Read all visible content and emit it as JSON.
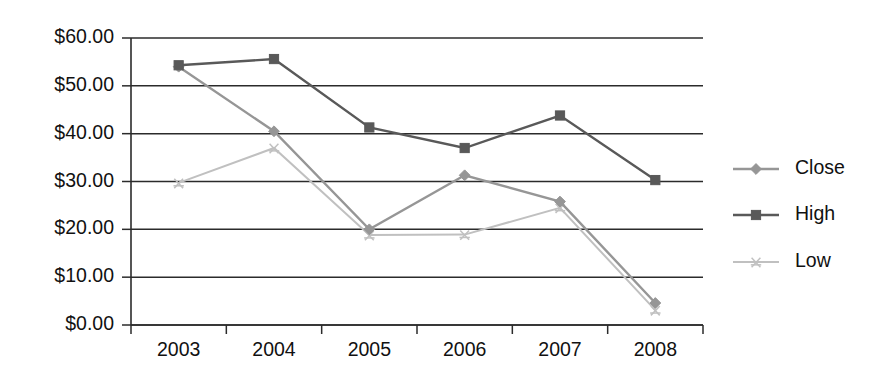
{
  "chart_data": {
    "type": "line",
    "title": "",
    "subtitle": "",
    "xlabel": "",
    "ylabel": "",
    "categories": [
      "2003",
      "2004",
      "2005",
      "2006",
      "2007",
      "2008"
    ],
    "ytick_labels": [
      "$60.00",
      "$50.00",
      "$40.00",
      "$30.00",
      "$20.00",
      "$10.00",
      "$0.00"
    ],
    "ytick_values": [
      60,
      50,
      40,
      30,
      20,
      10,
      0
    ],
    "ylim": [
      0,
      60
    ],
    "grid": "horizontal",
    "legend_position": "right",
    "series": [
      {
        "name": "Close",
        "color": "#969696",
        "marker": "diamond",
        "values": [
          54.0,
          40.5,
          20.0,
          31.3,
          25.8,
          4.6
        ]
      },
      {
        "name": "High",
        "color": "#595959",
        "marker": "square",
        "values": [
          54.3,
          55.6,
          41.3,
          37.0,
          43.8,
          30.3
        ]
      },
      {
        "name": "Low",
        "color": "#c0c0c0",
        "marker": "star",
        "values": [
          29.7,
          37.0,
          18.8,
          18.9,
          24.5,
          3.1
        ]
      }
    ]
  },
  "axis_color": "#2b2b2b",
  "background": "#ffffff"
}
